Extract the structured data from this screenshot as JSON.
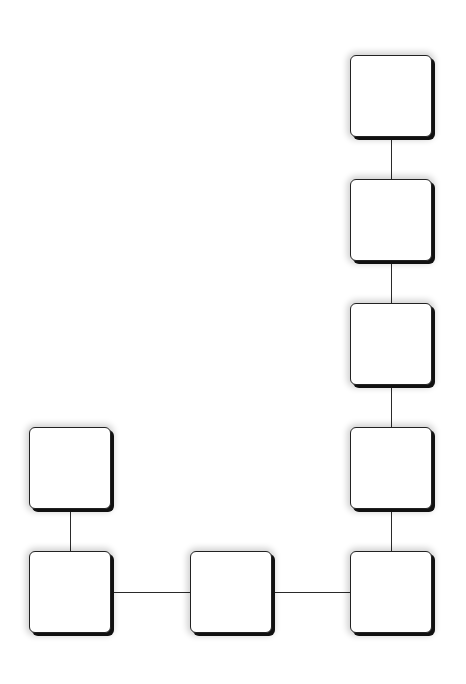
{
  "diagram": {
    "type": "node-graph",
    "node_size": 82,
    "colors": {
      "node_fill": "#ffffff",
      "node_border": "#222222",
      "edge": "#2a2a2a",
      "background": "#ffffff"
    },
    "nodes": [
      {
        "id": "n1",
        "label": "",
        "x": 350,
        "y": 55
      },
      {
        "id": "n2",
        "label": "",
        "x": 350,
        "y": 179
      },
      {
        "id": "n3",
        "label": "",
        "x": 350,
        "y": 303
      },
      {
        "id": "n4",
        "label": "",
        "x": 350,
        "y": 427
      },
      {
        "id": "n5",
        "label": "",
        "x": 350,
        "y": 551
      },
      {
        "id": "n6",
        "label": "",
        "x": 190,
        "y": 551
      },
      {
        "id": "n7",
        "label": "",
        "x": 29,
        "y": 551
      },
      {
        "id": "n8",
        "label": "",
        "x": 29,
        "y": 427
      }
    ],
    "edges": [
      {
        "from": "n1",
        "to": "n2"
      },
      {
        "from": "n2",
        "to": "n3"
      },
      {
        "from": "n3",
        "to": "n4"
      },
      {
        "from": "n4",
        "to": "n5"
      },
      {
        "from": "n5",
        "to": "n6"
      },
      {
        "from": "n6",
        "to": "n7"
      },
      {
        "from": "n7",
        "to": "n8"
      }
    ]
  }
}
